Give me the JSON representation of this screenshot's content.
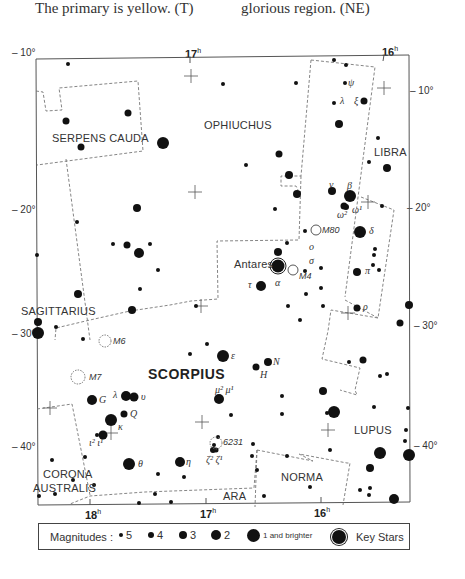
{
  "captions": {
    "left": "The primary is yellow. (T)",
    "right": "glorious region. (NE)"
  },
  "ra_labels_top": [
    {
      "h": "17",
      "x": 179
    },
    {
      "h": "16",
      "x": 379
    }
  ],
  "ra_labels_bottom": [
    {
      "h": "18",
      "x": 88
    },
    {
      "h": "17",
      "x": 201
    },
    {
      "h": "16",
      "x": 315
    }
  ],
  "dec_labels_left": [
    {
      "text": "10°",
      "y": 53
    },
    {
      "text": "20°",
      "y": 211
    },
    {
      "text": "30°",
      "y": 363
    },
    {
      "text": "40°",
      "y": 448
    }
  ],
  "dec_labels_right": [
    {
      "text": "10°",
      "y": 53
    },
    {
      "text": "20°",
      "y": 208
    },
    {
      "text": "30°",
      "y": 326
    },
    {
      "text": "40°",
      "y": 446
    }
  ],
  "constellations": {
    "serpens_cauda": "SERPENS CAUDA",
    "ophiuchus": "OPHIUCHUS",
    "libra": "LIBRA",
    "sagittarius": "SAGITTARIUS",
    "scorpius": "SCORPIUS",
    "lupus": "LUPUS",
    "corona": "CORONA",
    "australis": "AUSTRALIS",
    "norma": "NORMA",
    "ara": "ARA"
  },
  "star_labels": {
    "antares": "Antares",
    "alpha": "α",
    "beta": "β",
    "delta": "δ",
    "pi": "π",
    "rho": "ρ",
    "sigma": "σ",
    "tau": "τ",
    "omicron": "o",
    "nu": "ν",
    "omega1": "ω¹",
    "omega2": "ω²",
    "psi": "ψ",
    "lambda_oph": "λ",
    "xi": "ξ",
    "epsilon": "ε",
    "mu": "μ² μ¹",
    "N": "N",
    "H": "H",
    "G": "G",
    "Q": "Q",
    "lambda": "λ",
    "upsilon": "υ",
    "kappa": "κ",
    "iota": "ι² ι¹",
    "theta": "θ",
    "eta": "η",
    "zeta": "ζ² ζ¹"
  },
  "objects": {
    "m80": "M80",
    "m4": "M4",
    "m6": "M6",
    "m7": "M7",
    "ngc6231": "6231"
  },
  "legend": {
    "title": "Magnitudes :",
    "items": [
      {
        "label": "5",
        "size": 4
      },
      {
        "label": "4",
        "size": 6
      },
      {
        "label": "3",
        "size": 8
      },
      {
        "label": "2",
        "size": 10
      },
      {
        "label": "1 and brighter",
        "size": 13
      }
    ],
    "key_stars": "Key Stars"
  }
}
